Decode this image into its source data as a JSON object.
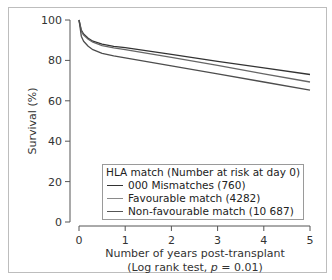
{
  "chart_data": {
    "type": "line",
    "title": "",
    "xlabel": "Number of years post-transplant",
    "xlabel_sub": "(Log rank test, p = 0.01)",
    "ylabel": "Survival (%)",
    "xlim": [
      0,
      5
    ],
    "ylim": [
      0,
      100
    ],
    "xticks": [
      0,
      1,
      2,
      3,
      4,
      5
    ],
    "yticks": [
      0,
      20,
      40,
      60,
      80,
      100
    ],
    "grid": false,
    "legend_position": "lower-center inside",
    "legend_title": "HLA match (Number at risk at day 0)",
    "series": [
      {
        "name": "000 Mismatches (760)",
        "color": "#333333",
        "x": [
          0,
          0.05,
          0.1,
          0.2,
          0.3,
          0.5,
          0.75,
          1,
          2,
          3,
          4,
          5
        ],
        "values": [
          100,
          95,
          93,
          91,
          89.5,
          88,
          87,
          86.3,
          83,
          79.5,
          76.3,
          73
        ]
      },
      {
        "name": "Favourable match (4282)",
        "color": "#666666",
        "x": [
          0,
          0.05,
          0.1,
          0.2,
          0.3,
          0.5,
          0.75,
          1,
          2,
          3,
          4,
          5
        ],
        "values": [
          100,
          94.5,
          92.5,
          90.5,
          89,
          87.3,
          86.2,
          85.3,
          81.5,
          77.5,
          73.3,
          69.3
        ]
      },
      {
        "name": "Non-favourable match (10 687)",
        "color": "#4d4d4d",
        "x": [
          0,
          0.05,
          0.1,
          0.2,
          0.3,
          0.5,
          0.75,
          1,
          2,
          3,
          4,
          5
        ],
        "values": [
          100,
          92,
          89.5,
          87,
          85.3,
          83.5,
          82.3,
          81.3,
          77.3,
          73.3,
          69.3,
          65.3
        ]
      }
    ]
  },
  "legend": {
    "title": "HLA match (Number at risk at day 0)",
    "items": [
      {
        "label": "000 Mismatches (760)",
        "color": "#333333"
      },
      {
        "label": "Favourable match (4282)",
        "color": "#8a8a8a"
      },
      {
        "label": "Non-favourable match (10 687)",
        "color": "#555555"
      }
    ]
  },
  "axes": {
    "ylabel": "Survival (%)",
    "xlabel": "Number of years post-transplant",
    "xlabel_sub_prefix": "(Log rank test, ",
    "xlabel_sub_p": "p",
    "xlabel_sub_suffix": " = 0.01)",
    "yticks": [
      "0",
      "20",
      "40",
      "60",
      "80",
      "100"
    ],
    "xticks": [
      "0",
      "1",
      "2",
      "3",
      "4",
      "5"
    ]
  }
}
